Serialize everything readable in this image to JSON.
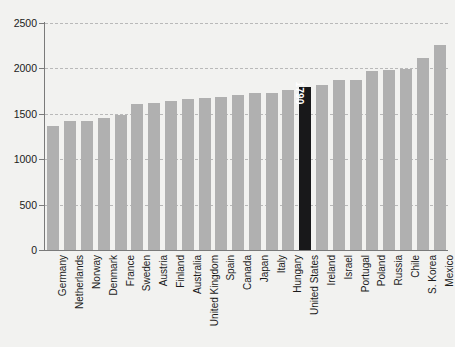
{
  "chart_data": {
    "type": "bar",
    "title": "",
    "subtitle": "",
    "xlabel": "",
    "ylabel": "",
    "ylim": [
      0,
      2500
    ],
    "yticks": [
      0,
      500,
      1000,
      1500,
      2000,
      2500
    ],
    "ytick_labels": [
      "0",
      "500",
      "1000",
      "1500",
      "2000",
      "2500"
    ],
    "grid": true,
    "grid_style": "dashed-horizontal",
    "legend": "none",
    "categories": [
      "Germany",
      "Netherlands",
      "Norway",
      "Denmark",
      "France",
      "Sweden",
      "Austria",
      "Finland",
      "Australia",
      "United Kingdom",
      "Spain",
      "Canada",
      "Japan",
      "Italy",
      "Hungary",
      "United States",
      "Ireland",
      "Israel",
      "Portugal",
      "Poland",
      "Russia",
      "Chile",
      "S. Korea",
      "Mexico"
    ],
    "values": [
      1371,
      1419,
      1420,
      1457,
      1482,
      1609,
      1621,
      1643,
      1664,
      1670,
      1690,
      1708,
      1729,
      1734,
      1761,
      1790,
      1820,
      1867,
      1872,
      1976,
      1985,
      1998,
      2119,
      2255
    ],
    "highlight_index": 15,
    "highlight_label": "1790",
    "colors": {
      "bar": "#b0b0b0",
      "bar_highlight": "#18181a",
      "highlight_text": "#ffffff",
      "axis": "#7a7a7a",
      "gridline": "#b9b9b9",
      "text": "#1b1b1b",
      "background": "#f2f2f0"
    }
  }
}
